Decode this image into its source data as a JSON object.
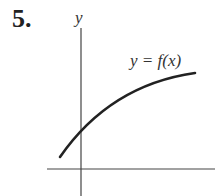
{
  "problem": {
    "number": "5."
  },
  "graph": {
    "y_axis_label": "y",
    "x_axis_label": "x",
    "curve_label": "y = f(x)",
    "curve_description": "increasing, concave down curve crossing positive y-axis",
    "colors": {
      "ink": "#222222",
      "axis": "#444444",
      "background": "#ffffff"
    }
  }
}
